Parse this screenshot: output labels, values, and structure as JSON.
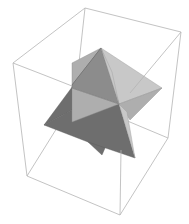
{
  "figure": {
    "type": "3d-graphics",
    "background": "#ffffff",
    "box": {
      "edge_color": "#b4b4b4",
      "vertices": {
        "top_back": [
          85,
          8
        ],
        "top_right": [
          181,
          32
        ],
        "top_left": [
          13,
          63
        ],
        "top_front": [
          109,
          87
        ],
        "bottom_back": [
          75,
          99
        ],
        "bottom_left": [
          27,
          176
        ],
        "bottom_right": [
          168,
          138
        ],
        "bottom_front": [
          120,
          215
        ]
      }
    },
    "shape": {
      "colors": {
        "dark": "#6e6e6e",
        "mid": "#8c8c8c",
        "light": "#aeaeae",
        "pale": "#c8c8c8"
      },
      "apexes": {
        "top": [
          101,
          48
        ],
        "left": [
          44,
          125
        ],
        "right": [
          162,
          88
        ],
        "bottom": [
          135,
          158
        ],
        "lower_left": [
          102,
          155
        ],
        "back_top": [
          72,
          63
        ]
      }
    }
  }
}
